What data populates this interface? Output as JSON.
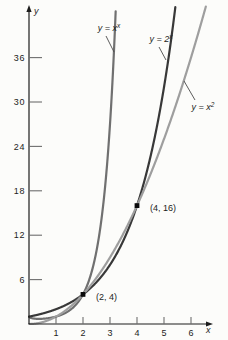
{
  "figure": {
    "background": "#fcfcfa",
    "axis_color": "#1c1c1c",
    "tick_color": "#6e6e6e",
    "text_color": "#1c1c1c",
    "leader_color": "#4a4a4a",
    "marker_color": "#0a0a0a"
  },
  "chart_data": {
    "type": "line",
    "title": "",
    "xlabel": "x",
    "ylabel": "y",
    "xlim": [
      0,
      6.6
    ],
    "ylim": [
      0,
      43
    ],
    "x_ticks": [
      1,
      2,
      3,
      4,
      5,
      6
    ],
    "y_ticks": [
      6,
      12,
      18,
      24,
      30,
      36
    ],
    "grid": false,
    "legend": "inline-curve-labels",
    "series": [
      {
        "id": "x-power-x",
        "fn": "x^x",
        "label_base": "y = x",
        "label_sup": "x",
        "color": "#707070",
        "domain": [
          0.02,
          3.4
        ],
        "sample_points": [
          [
            0.5,
            0.71
          ],
          [
            1,
            1
          ],
          [
            2,
            4
          ],
          [
            3,
            27
          ]
        ]
      },
      {
        "id": "two-power-x",
        "fn": "2^x",
        "label_base": "y = 2",
        "label_sup": "x",
        "color": "#383838",
        "domain": [
          0,
          5.7
        ],
        "sample_points": [
          [
            0,
            1
          ],
          [
            1,
            2
          ],
          [
            2,
            4
          ],
          [
            3,
            8
          ],
          [
            4,
            16
          ],
          [
            5,
            32
          ]
        ]
      },
      {
        "id": "x-squared",
        "fn": "x^2",
        "label_base": "y = x",
        "label_sup": "2",
        "color": "#9e9e9e",
        "domain": [
          0,
          6.6
        ],
        "sample_points": [
          [
            0,
            0
          ],
          [
            1,
            1
          ],
          [
            2,
            4
          ],
          [
            3,
            9
          ],
          [
            4,
            16
          ],
          [
            5,
            25
          ],
          [
            6,
            36
          ]
        ]
      }
    ],
    "points": [
      {
        "x": 2,
        "y": 4,
        "label": "(2, 4)"
      },
      {
        "x": 4,
        "y": 16,
        "label": "(4, 16)"
      }
    ]
  }
}
